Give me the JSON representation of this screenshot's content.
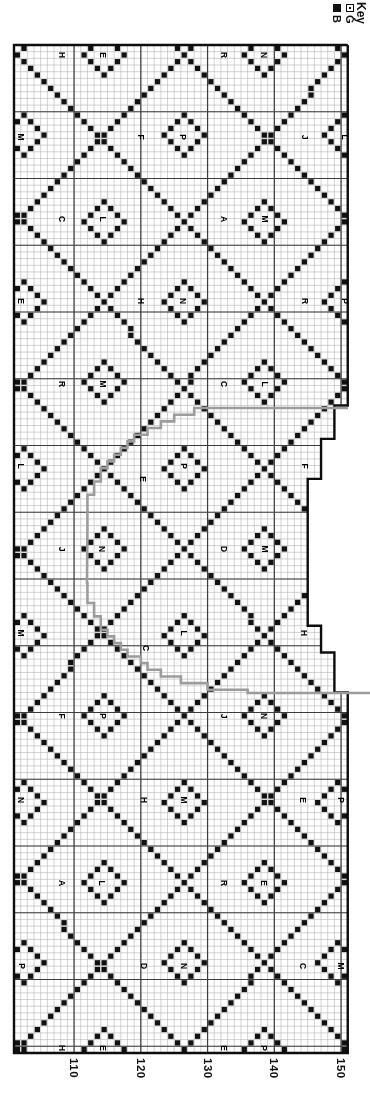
{
  "key": {
    "title": "Key",
    "entries": [
      {
        "symbol": "dotted-square",
        "label": "G"
      },
      {
        "symbol": "filled-square",
        "label": "B"
      }
    ]
  },
  "axis": {
    "labels": [
      {
        "text": "110",
        "x": 74
      },
      {
        "text": "120",
        "x": 141
      },
      {
        "text": "130",
        "x": 208
      },
      {
        "text": "140",
        "x": 274
      },
      {
        "text": "150",
        "x": 341
      }
    ],
    "baseline_y": 1058
  },
  "grid": {
    "x0": 14,
    "y0": 45,
    "cell": 6.675,
    "cols": 50,
    "rows": 151,
    "heavy_col_lines": [
      9,
      19,
      29,
      39,
      49
    ],
    "heavy_row_step": 10
  },
  "shaping_profile": [
    {
      "r0": 0,
      "r1": 53,
      "cols": 50
    },
    {
      "r0": 54,
      "r1": 58,
      "cols": 48
    },
    {
      "r0": 59,
      "r1": 64,
      "cols": 46
    },
    {
      "r0": 65,
      "r1": 86,
      "cols": 44
    },
    {
      "r0": 87,
      "r1": 90,
      "cols": 46
    },
    {
      "r0": 91,
      "r1": 96,
      "cols": 48
    },
    {
      "r0": 97,
      "r1": 150,
      "cols": 50
    }
  ],
  "lattice": {
    "ox": 20.5,
    "oy": 55,
    "ax": 81.7,
    "ay": 82.7,
    "ring_radius_cells": 3
  },
  "gray_outline": {
    "top_y": 408,
    "bottom_y": 693,
    "right_x": 348,
    "page_right_x": 370,
    "curve_x_outer": 248,
    "curve_x_inner": 87,
    "upper_arc": {
      "cx": 248,
      "cy": 527,
      "rx": 161,
      "ry": 119
    },
    "straight": {
      "x": 87,
      "y1": 527,
      "y2": 583
    },
    "lower_arc": {
      "cx": 248,
      "cy": 583,
      "rx": 161,
      "ry": 110
    }
  },
  "colors": {
    "square": "#111111",
    "grid_thin": "#b4b4b4",
    "grid_heavy": "#3c3c3c",
    "border": "#0d0d0d",
    "gray_line": "#9c9c9c",
    "background": "#ffffff"
  },
  "letters": [
    {
      "x": 62,
      "y": 55,
      "ch": "H",
      "ring": false
    },
    {
      "x": 103,
      "y": 55,
      "ch": "E",
      "ring": true
    },
    {
      "x": 224,
      "y": 55,
      "ch": "R",
      "ring": false
    },
    {
      "x": 264,
      "y": 55,
      "ch": "N",
      "ring": true
    },
    {
      "x": 21,
      "y": 137,
      "ch": "M",
      "ring": true
    },
    {
      "x": 141,
      "y": 137,
      "ch": "F",
      "ring": false
    },
    {
      "x": 183,
      "y": 137,
      "ch": "P",
      "ring": true
    },
    {
      "x": 305,
      "y": 137,
      "ch": "J",
      "ring": false
    },
    {
      "x": 345,
      "y": 137,
      "ch": "L",
      "ring": true
    },
    {
      "x": 62,
      "y": 219,
      "ch": "C",
      "ring": false
    },
    {
      "x": 103,
      "y": 219,
      "ch": "L",
      "ring": true
    },
    {
      "x": 224,
      "y": 219,
      "ch": "A",
      "ring": false
    },
    {
      "x": 265,
      "y": 219,
      "ch": "M",
      "ring": true
    },
    {
      "x": 21,
      "y": 301,
      "ch": "E",
      "ring": true
    },
    {
      "x": 141,
      "y": 301,
      "ch": "H",
      "ring": false
    },
    {
      "x": 183,
      "y": 301,
      "ch": "N",
      "ring": true
    },
    {
      "x": 305,
      "y": 301,
      "ch": "R",
      "ring": false
    },
    {
      "x": 345,
      "y": 301,
      "ch": "P",
      "ring": true
    },
    {
      "x": 62,
      "y": 384,
      "ch": "R",
      "ring": false
    },
    {
      "x": 103,
      "y": 384,
      "ch": "M",
      "ring": true
    },
    {
      "x": 224,
      "y": 384,
      "ch": "C",
      "ring": false
    },
    {
      "x": 265,
      "y": 384,
      "ch": "L",
      "ring": true
    },
    {
      "x": 21,
      "y": 466,
      "ch": "L",
      "ring": true
    },
    {
      "x": 143,
      "y": 479,
      "ch": "E",
      "ring": false
    },
    {
      "x": 184,
      "y": 466,
      "ch": "P",
      "ring": true
    },
    {
      "x": 305,
      "y": 466,
      "ch": "F",
      "ring": false
    },
    {
      "x": 62,
      "y": 549,
      "ch": "J",
      "ring": false
    },
    {
      "x": 102,
      "y": 549,
      "ch": "N",
      "ring": true
    },
    {
      "x": 224,
      "y": 549,
      "ch": "D",
      "ring": false
    },
    {
      "x": 265,
      "y": 549,
      "ch": "M",
      "ring": true
    },
    {
      "x": 21,
      "y": 633,
      "ch": "M",
      "ring": true
    },
    {
      "x": 146,
      "y": 648,
      "ch": "C",
      "ring": false
    },
    {
      "x": 184,
      "y": 633,
      "ch": "L",
      "ring": true
    },
    {
      "x": 304,
      "y": 633,
      "ch": "H",
      "ring": false
    },
    {
      "x": 62,
      "y": 716,
      "ch": "F",
      "ring": false
    },
    {
      "x": 103,
      "y": 716,
      "ch": "P",
      "ring": true
    },
    {
      "x": 224,
      "y": 716,
      "ch": "J",
      "ring": false
    },
    {
      "x": 264,
      "y": 716,
      "ch": "N",
      "ring": true
    },
    {
      "x": 21,
      "y": 800,
      "ch": "N",
      "ring": true
    },
    {
      "x": 144,
      "y": 800,
      "ch": "H",
      "ring": false
    },
    {
      "x": 184,
      "y": 800,
      "ch": "M",
      "ring": true
    },
    {
      "x": 303,
      "y": 800,
      "ch": "E",
      "ring": false
    },
    {
      "x": 341,
      "y": 800,
      "ch": "P",
      "ring": true
    },
    {
      "x": 62,
      "y": 883,
      "ch": "A",
      "ring": false
    },
    {
      "x": 102,
      "y": 883,
      "ch": "L",
      "ring": true
    },
    {
      "x": 224,
      "y": 883,
      "ch": "R",
      "ring": false
    },
    {
      "x": 264,
      "y": 883,
      "ch": "E",
      "ring": true
    },
    {
      "x": 22,
      "y": 966,
      "ch": "P",
      "ring": true
    },
    {
      "x": 144,
      "y": 966,
      "ch": "D",
      "ring": false
    },
    {
      "x": 184,
      "y": 966,
      "ch": "N",
      "ring": true
    },
    {
      "x": 303,
      "y": 966,
      "ch": "C",
      "ring": false
    },
    {
      "x": 341,
      "y": 966,
      "ch": "M",
      "ring": true
    },
    {
      "x": 62,
      "y": 1048,
      "ch": "H",
      "ring": false
    },
    {
      "x": 103,
      "y": 1048,
      "ch": "E",
      "ring": true
    },
    {
      "x": 224,
      "y": 1048,
      "ch": "E",
      "ring": false
    },
    {
      "x": 264,
      "y": 1048,
      "ch": "P",
      "ring": true
    }
  ]
}
